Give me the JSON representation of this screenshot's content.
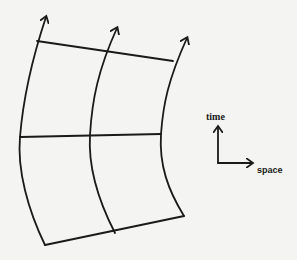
{
  "figure": {
    "axes": {
      "vertical_label": "time",
      "horizontal_label": "space"
    },
    "worldlines": [
      {
        "name": "left",
        "points": [
          [
            45,
            245
          ],
          [
            20,
            137
          ],
          [
            37,
            41
          ]
        ],
        "arrow_tip": [
          46,
          17
        ]
      },
      {
        "name": "middle",
        "points": [
          [
            115,
            233
          ],
          [
            90,
            135
          ],
          [
            106,
            50
          ]
        ],
        "arrow_tip": [
          117,
          28
        ]
      },
      {
        "name": "right",
        "points": [
          [
            184,
            216
          ],
          [
            161,
            134
          ],
          [
            173,
            61
          ]
        ],
        "arrow_tip": [
          187,
          38
        ]
      }
    ],
    "cross_lines": [
      {
        "name": "top",
        "from": [
          37,
          41
        ],
        "to": [
          173,
          61
        ]
      },
      {
        "name": "middle",
        "from": [
          20,
          137
        ],
        "to": [
          161,
          134
        ]
      },
      {
        "name": "bottom",
        "from": [
          45,
          245
        ],
        "to": [
          184,
          216
        ]
      }
    ],
    "stroke_color": "#1a1a1a",
    "background_color": "#f4f4f2"
  }
}
